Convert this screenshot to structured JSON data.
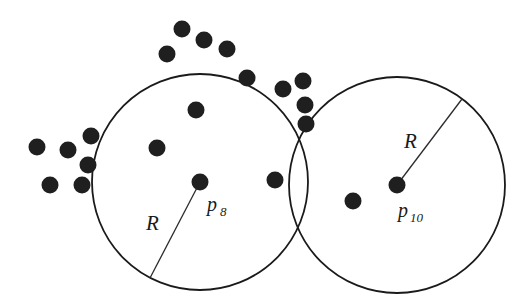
{
  "figure": {
    "background_color": "#ffffff",
    "stroke_color": "#1a1a1a",
    "dot_color": "#1f1f1f",
    "width": 530,
    "height": 306
  },
  "circles": [
    {
      "id": "circle-p8",
      "center_label": "p",
      "center_subscript": "8",
      "cx": 200,
      "cy": 182,
      "r": 108,
      "radius_label": "R",
      "radius_label_x": 146,
      "radius_label_y": 230,
      "radius_line": {
        "x1": 200,
        "y1": 182,
        "x2": 150,
        "y2": 278
      },
      "center_label_x": 207,
      "center_label_y": 211,
      "center_sub_x": 220,
      "center_sub_y": 216
    },
    {
      "id": "circle-p10",
      "center_label": "p",
      "center_subscript": "10",
      "cx": 397,
      "cy": 185,
      "r": 108,
      "radius_label": "R",
      "radius_label_x": 404,
      "radius_label_y": 148,
      "radius_line": {
        "x1": 397,
        "y1": 185,
        "x2": 462,
        "y2": 99
      },
      "center_label_x": 398,
      "center_label_y": 217,
      "center_sub_x": 410,
      "center_sub_y": 222
    }
  ],
  "points": {
    "radius": 8.5,
    "left_cluster": [
      {
        "cx": 37,
        "cy": 147
      },
      {
        "cx": 68,
        "cy": 150
      },
      {
        "cx": 91,
        "cy": 136
      },
      {
        "cx": 88,
        "cy": 165
      },
      {
        "cx": 50,
        "cy": 185
      },
      {
        "cx": 82,
        "cy": 185
      }
    ],
    "top_arc": [
      {
        "cx": 182,
        "cy": 29
      },
      {
        "cx": 204,
        "cy": 40
      },
      {
        "cx": 227,
        "cy": 49
      },
      {
        "cx": 167,
        "cy": 54
      },
      {
        "cx": 247,
        "cy": 78
      },
      {
        "cx": 283,
        "cy": 89
      },
      {
        "cx": 303,
        "cy": 81
      }
    ],
    "near_intersection": [
      {
        "cx": 305,
        "cy": 105
      },
      {
        "cx": 306,
        "cy": 124
      }
    ],
    "inside_left_circle": [
      {
        "cx": 196,
        "cy": 110
      },
      {
        "cx": 157,
        "cy": 148
      },
      {
        "cx": 275,
        "cy": 180
      }
    ],
    "inside_right_circle": [
      {
        "cx": 353,
        "cy": 201
      }
    ]
  }
}
